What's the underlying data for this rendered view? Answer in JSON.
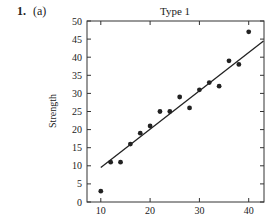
{
  "problem": {
    "number": "1.",
    "part": "(a)"
  },
  "chart_data": {
    "type": "scatter",
    "title": "Type 1",
    "xlabel": "",
    "ylabel": "Strength",
    "xlim": [
      7.2,
      43.1
    ],
    "ylim": [
      0,
      50
    ],
    "xticks": [
      10,
      20,
      30,
      40
    ],
    "yticks": [
      0,
      5,
      10,
      15,
      20,
      25,
      30,
      35,
      40,
      45,
      50
    ],
    "grid": false,
    "legend": null,
    "series": [
      {
        "name": "Type 1",
        "x": [
          10,
          12,
          14,
          16,
          18,
          20,
          22,
          24,
          26,
          28,
          30,
          32,
          34,
          36,
          38,
          40
        ],
        "y": [
          3,
          11,
          11,
          16,
          19,
          21,
          25,
          25,
          29,
          26,
          31,
          33,
          32,
          39,
          38,
          47
        ]
      }
    ],
    "fit_line": {
      "x": [
        10,
        43
      ],
      "y": [
        9.5,
        44.5
      ]
    }
  }
}
